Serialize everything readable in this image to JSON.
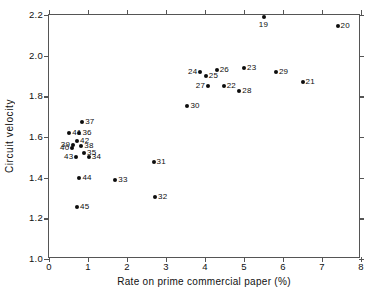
{
  "chart_data": {
    "type": "scatter",
    "title": "",
    "xlabel": "Rate on prime commercial paper (%)",
    "ylabel": "Circuit velocity",
    "xlim": [
      0,
      8
    ],
    "ylim": [
      1.0,
      2.2
    ],
    "xticks": [
      0,
      1,
      2,
      3,
      4,
      5,
      6,
      7,
      8
    ],
    "xticklabels": [
      "0",
      "1",
      "2",
      "3",
      "4",
      "5",
      "6",
      "7",
      "8"
    ],
    "yticks": [
      1.0,
      1.2,
      1.4,
      1.6,
      1.8,
      2.0,
      2.2
    ],
    "yticklabels": [
      "1.0",
      "1.2",
      "1.4",
      "1.6",
      "1.8",
      "2.0",
      "2.2"
    ],
    "grid": false,
    "legend": null,
    "marker": "filled-circle",
    "marker_color": "#0d0d0d",
    "points": [
      {
        "label": "19",
        "x": 5.5,
        "y": 2.19,
        "label_pos": "below"
      },
      {
        "label": "20",
        "x": 7.4,
        "y": 2.145,
        "label_pos": "right"
      },
      {
        "label": "21",
        "x": 6.5,
        "y": 1.872,
        "label_pos": "right"
      },
      {
        "label": "22",
        "x": 4.48,
        "y": 1.853,
        "label_pos": "right"
      },
      {
        "label": "23",
        "x": 5.0,
        "y": 1.938,
        "label_pos": "right"
      },
      {
        "label": "24",
        "x": 3.88,
        "y": 1.918,
        "label_pos": "left"
      },
      {
        "label": "25",
        "x": 4.02,
        "y": 1.898,
        "label_pos": "right"
      },
      {
        "label": "26",
        "x": 4.3,
        "y": 1.93,
        "label_pos": "right"
      },
      {
        "label": "27",
        "x": 4.08,
        "y": 1.852,
        "label_pos": "left"
      },
      {
        "label": "28",
        "x": 4.88,
        "y": 1.828,
        "label_pos": "right"
      },
      {
        "label": "29",
        "x": 5.82,
        "y": 1.918,
        "label_pos": "right"
      },
      {
        "label": "30",
        "x": 3.55,
        "y": 1.752,
        "label_pos": "right"
      },
      {
        "label": "31",
        "x": 2.68,
        "y": 1.475,
        "label_pos": "right"
      },
      {
        "label": "32",
        "x": 2.72,
        "y": 1.303,
        "label_pos": "right"
      },
      {
        "label": "33",
        "x": 1.7,
        "y": 1.39,
        "label_pos": "right"
      },
      {
        "label": "34",
        "x": 1.02,
        "y": 1.5,
        "label_pos": "right"
      },
      {
        "label": "35",
        "x": 0.9,
        "y": 1.522,
        "label_pos": "right"
      },
      {
        "label": "36",
        "x": 0.78,
        "y": 1.618,
        "label_pos": "right"
      },
      {
        "label": "37",
        "x": 0.85,
        "y": 1.675,
        "label_pos": "right"
      },
      {
        "label": "38",
        "x": 0.83,
        "y": 1.555,
        "label_pos": "right"
      },
      {
        "label": "39",
        "x": 0.62,
        "y": 1.563,
        "label_pos": "left"
      },
      {
        "label": "40",
        "x": 0.6,
        "y": 1.545,
        "label_pos": "left"
      },
      {
        "label": "41",
        "x": 0.52,
        "y": 1.618,
        "label_pos": "right"
      },
      {
        "label": "42",
        "x": 0.72,
        "y": 1.578,
        "label_pos": "right"
      },
      {
        "label": "43",
        "x": 0.7,
        "y": 1.5,
        "label_pos": "left"
      },
      {
        "label": "44",
        "x": 0.78,
        "y": 1.398,
        "label_pos": "right"
      },
      {
        "label": "45",
        "x": 0.72,
        "y": 1.258,
        "label_pos": "right"
      }
    ]
  }
}
